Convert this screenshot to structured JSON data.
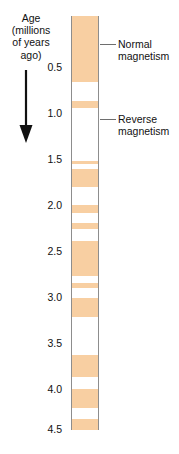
{
  "figure": {
    "type": "magnetostratigraphy-polarity-column",
    "background_color": "#ffffff"
  },
  "axis": {
    "heading_lines": [
      "Age",
      "(millions",
      "of years",
      "ago)"
    ],
    "arrow_direction": "down",
    "arrow_meaning": "increasing age downward",
    "units": "millions of years ago",
    "min": 0.0,
    "max": 4.5,
    "tick_labels": [
      "0.5",
      "1.0",
      "1.5",
      "2.0",
      "2.5",
      "3.0",
      "3.5",
      "4.0",
      "4.5"
    ],
    "tick_values": [
      0.5,
      1.0,
      1.5,
      2.0,
      2.5,
      3.0,
      3.5,
      4.0,
      4.5
    ]
  },
  "legend": {
    "normal": {
      "line1": "Normal",
      "line2": "magnetism",
      "color": "#f8cfa2"
    },
    "reverse": {
      "line1": "Reverse",
      "line2": "magnetism",
      "color": "#ffffff"
    }
  },
  "chart_data": {
    "type": "bar",
    "title": "",
    "xlabel": "",
    "ylabel": "Age (millions of years ago)",
    "ylim": [
      0.0,
      4.5
    ],
    "grid": false,
    "legend_position": "right",
    "categories": [
      "Normal magnetism",
      "Reverse magnetism"
    ],
    "values": [
      1.74,
      2.76
    ],
    "series": [
      {
        "name": "Normal magnetism",
        "color": "#f8cfa2",
        "intervals": [
          [
            0.0,
            0.72
          ],
          [
            0.92,
            1.0
          ],
          [
            1.58,
            1.61
          ],
          [
            1.66,
            1.86
          ],
          [
            2.05,
            2.14
          ],
          [
            2.25,
            2.31
          ],
          [
            2.45,
            2.83
          ],
          [
            2.9,
            2.96
          ],
          [
            3.06,
            3.27
          ],
          [
            3.69,
            3.92
          ],
          [
            4.05,
            4.26
          ],
          [
            4.38,
            4.5
          ]
        ]
      },
      {
        "name": "Reverse magnetism",
        "color": "#ffffff",
        "intervals": [
          [
            0.72,
            0.92
          ],
          [
            1.0,
            1.58
          ],
          [
            1.61,
            1.66
          ],
          [
            1.86,
            2.05
          ],
          [
            2.14,
            2.25
          ],
          [
            2.31,
            2.45
          ],
          [
            2.83,
            2.9
          ],
          [
            2.96,
            3.06
          ],
          [
            3.27,
            3.69
          ],
          [
            3.92,
            4.05
          ],
          [
            4.26,
            4.38
          ]
        ]
      }
    ]
  }
}
